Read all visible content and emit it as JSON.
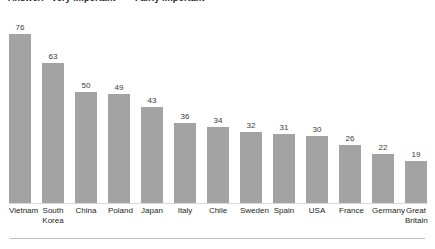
{
  "header": {
    "note": "Answer: \"Very important\" + \"Fairly important\""
  },
  "chart_data": {
    "type": "bar",
    "title": "Answer: \"Very important\" + \"Fairly important\"",
    "xlabel": "",
    "ylabel": "",
    "ylim": [
      0,
      80
    ],
    "grid": false,
    "legend": "none",
    "bar_color": "#a3a3a3",
    "label_color": "#3a3a3a",
    "categories": [
      "Vietnam",
      "South Korea",
      "China",
      "Poland",
      "Japan",
      "Italy",
      "Chile",
      "Sweden",
      "Spain",
      "USA",
      "France",
      "Germany",
      "Great Britain"
    ],
    "values": [
      76,
      63,
      50,
      49,
      43,
      36,
      34,
      32,
      31,
      30,
      26,
      22,
      19
    ],
    "value_labels": [
      "76",
      "63",
      "50",
      "49",
      "43",
      "36",
      "34",
      "32",
      "31",
      "30",
      "26",
      "22",
      "19"
    ]
  }
}
